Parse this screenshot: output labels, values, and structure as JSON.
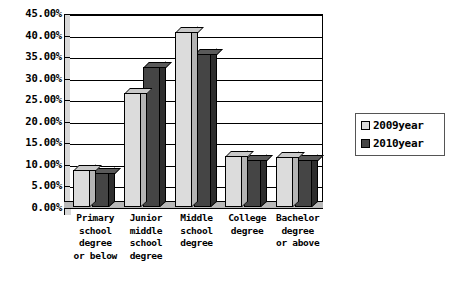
{
  "chart_data": {
    "type": "bar",
    "title": "",
    "subtitle": "",
    "xlabel": "",
    "ylabel": "",
    "ylim": [
      0,
      45
    ],
    "ytick_labels": [
      "45.00%",
      "40.00%",
      "35.00%",
      "30.00%",
      "25.00%",
      "20.00%",
      "15.00%",
      "10.00%",
      "5.00%",
      "0.00%"
    ],
    "ytick_values": [
      45,
      40,
      35,
      30,
      25,
      20,
      15,
      10,
      5,
      0
    ],
    "grid": true,
    "legend_position": "right",
    "categories": [
      "Primary school degree or below",
      "Junior middle school degree",
      "Middle school degree",
      "College degree",
      "Bachelor degree or above"
    ],
    "category_lines": [
      [
        "Primary",
        "school",
        "degree",
        "or below"
      ],
      [
        "Junior",
        "middle",
        "school",
        "degree"
      ],
      [
        "Middle",
        "school",
        "degree"
      ],
      [
        "College",
        "degree"
      ],
      [
        "Bachelor",
        "degree",
        "or above"
      ]
    ],
    "series": [
      {
        "name": "2009year",
        "color": "#dcdcdc",
        "values": [
          8.5,
          26.5,
          40.5,
          11.8,
          11.5
        ]
      },
      {
        "name": "2010year",
        "color": "#454545",
        "values": [
          8.0,
          32.5,
          35.5,
          10.8,
          10.8
        ]
      }
    ]
  },
  "legend": {
    "items": [
      {
        "label": "2009year",
        "color": "#dcdcdc"
      },
      {
        "label": "2010year",
        "color": "#454545"
      }
    ]
  }
}
